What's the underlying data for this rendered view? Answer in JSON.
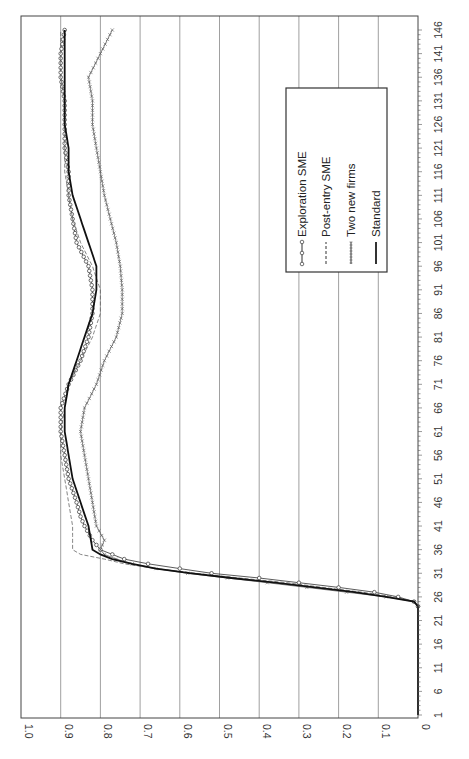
{
  "chart_data": {
    "type": "line",
    "orientation": "rotated-90-ccw",
    "title": "",
    "xlabel": "",
    "ylabel": "",
    "ylim": [
      0,
      1.0
    ],
    "xlim": [
      1,
      146
    ],
    "y_ticks": [
      "0",
      "0.1",
      "0.2",
      "0.3",
      "0.4",
      "0.5",
      "0.6",
      "0.7",
      "0.8",
      "0.9",
      "1.0"
    ],
    "x_ticks": [
      "1",
      "6",
      "11",
      "16",
      "21",
      "26",
      "31",
      "36",
      "41",
      "46",
      "51",
      "56",
      "61",
      "66",
      "71",
      "76",
      "81",
      "86",
      "91",
      "96",
      "101",
      "106",
      "111",
      "116",
      "121",
      "126",
      "131",
      "136",
      "141",
      "146"
    ],
    "grid": true,
    "legend_position": "upper-right (inside plot)",
    "series": [
      {
        "name": "Exploration SME",
        "style": "line-circle",
        "points": [
          [
            1,
            0
          ],
          [
            24,
            0
          ],
          [
            25,
            0.01
          ],
          [
            26,
            0.05
          ],
          [
            27,
            0.11
          ],
          [
            28,
            0.2
          ],
          [
            29,
            0.3
          ],
          [
            30,
            0.4
          ],
          [
            31,
            0.52
          ],
          [
            32,
            0.6
          ],
          [
            33,
            0.68
          ],
          [
            34,
            0.74
          ],
          [
            35,
            0.77
          ],
          [
            36,
            0.8
          ],
          [
            38,
            0.82
          ],
          [
            41,
            0.84
          ],
          [
            43,
            0.85
          ],
          [
            46,
            0.86
          ],
          [
            51,
            0.88
          ],
          [
            56,
            0.89
          ],
          [
            61,
            0.9
          ],
          [
            66,
            0.9
          ],
          [
            71,
            0.88
          ],
          [
            76,
            0.85
          ],
          [
            81,
            0.83
          ],
          [
            86,
            0.82
          ],
          [
            91,
            0.82
          ],
          [
            96,
            0.83
          ],
          [
            101,
            0.86
          ],
          [
            106,
            0.87
          ],
          [
            111,
            0.88
          ],
          [
            116,
            0.88
          ],
          [
            121,
            0.89
          ],
          [
            126,
            0.89
          ],
          [
            131,
            0.89
          ],
          [
            136,
            0.9
          ],
          [
            141,
            0.9
          ],
          [
            146,
            0.89
          ]
        ]
      },
      {
        "name": "Post-entry SME",
        "style": "dashed",
        "points": [
          [
            1,
            0
          ],
          [
            24,
            0
          ],
          [
            25,
            0.01
          ],
          [
            26,
            0.06
          ],
          [
            27,
            0.14
          ],
          [
            28,
            0.24
          ],
          [
            29,
            0.33
          ],
          [
            30,
            0.45
          ],
          [
            31,
            0.56
          ],
          [
            32,
            0.66
          ],
          [
            33,
            0.74
          ],
          [
            34,
            0.79
          ],
          [
            35,
            0.85
          ],
          [
            36,
            0.87
          ],
          [
            41,
            0.87
          ],
          [
            46,
            0.88
          ],
          [
            51,
            0.89
          ],
          [
            56,
            0.9
          ],
          [
            61,
            0.9
          ],
          [
            66,
            0.89
          ],
          [
            71,
            0.88
          ],
          [
            76,
            0.85
          ],
          [
            81,
            0.82
          ],
          [
            86,
            0.8
          ],
          [
            91,
            0.8
          ],
          [
            96,
            0.82
          ],
          [
            101,
            0.85
          ],
          [
            106,
            0.87
          ],
          [
            111,
            0.88
          ],
          [
            116,
            0.89
          ],
          [
            121,
            0.89
          ],
          [
            126,
            0.89
          ],
          [
            131,
            0.89
          ],
          [
            136,
            0.9
          ],
          [
            141,
            0.9
          ],
          [
            146,
            0.9
          ]
        ]
      },
      {
        "name": "Two new firms",
        "style": "line-cross",
        "points": [
          [
            1,
            0
          ],
          [
            24,
            0
          ],
          [
            25,
            0.01
          ],
          [
            26,
            0.08
          ],
          [
            27,
            0.18
          ],
          [
            28,
            0.28
          ],
          [
            29,
            0.38
          ],
          [
            30,
            0.48
          ],
          [
            31,
            0.58
          ],
          [
            32,
            0.66
          ],
          [
            33,
            0.72
          ],
          [
            34,
            0.76
          ],
          [
            35,
            0.79
          ],
          [
            36,
            0.8
          ],
          [
            38,
            0.79
          ],
          [
            41,
            0.81
          ],
          [
            46,
            0.82
          ],
          [
            51,
            0.83
          ],
          [
            56,
            0.84
          ],
          [
            61,
            0.85
          ],
          [
            66,
            0.84
          ],
          [
            71,
            0.81
          ],
          [
            76,
            0.79
          ],
          [
            81,
            0.76
          ],
          [
            86,
            0.745
          ],
          [
            91,
            0.745
          ],
          [
            96,
            0.75
          ],
          [
            101,
            0.76
          ],
          [
            106,
            0.775
          ],
          [
            111,
            0.79
          ],
          [
            116,
            0.8
          ],
          [
            121,
            0.81
          ],
          [
            126,
            0.82
          ],
          [
            131,
            0.82
          ],
          [
            136,
            0.83
          ],
          [
            141,
            0.8
          ],
          [
            146,
            0.77
          ]
        ]
      },
      {
        "name": "Standard",
        "style": "solid-bold",
        "points": [
          [
            1,
            0
          ],
          [
            24,
            0
          ],
          [
            25,
            0.01
          ],
          [
            26,
            0.08
          ],
          [
            27,
            0.16
          ],
          [
            28,
            0.26
          ],
          [
            29,
            0.36
          ],
          [
            30,
            0.47
          ],
          [
            31,
            0.57
          ],
          [
            32,
            0.66
          ],
          [
            33,
            0.72
          ],
          [
            34,
            0.77
          ],
          [
            35,
            0.8
          ],
          [
            36,
            0.82
          ],
          [
            41,
            0.83
          ],
          [
            46,
            0.85
          ],
          [
            51,
            0.87
          ],
          [
            56,
            0.88
          ],
          [
            61,
            0.89
          ],
          [
            66,
            0.89
          ],
          [
            71,
            0.88
          ],
          [
            76,
            0.86
          ],
          [
            81,
            0.84
          ],
          [
            86,
            0.82
          ],
          [
            91,
            0.81
          ],
          [
            96,
            0.81
          ],
          [
            101,
            0.83
          ],
          [
            106,
            0.85
          ],
          [
            111,
            0.87
          ],
          [
            116,
            0.88
          ],
          [
            121,
            0.88
          ],
          [
            126,
            0.89
          ],
          [
            131,
            0.89
          ],
          [
            136,
            0.89
          ],
          [
            141,
            0.89
          ],
          [
            146,
            0.89
          ]
        ]
      }
    ]
  },
  "legend": {
    "items": [
      {
        "label": "Exploration SME"
      },
      {
        "label": "Post-entry SME"
      },
      {
        "label": "Two new firms"
      },
      {
        "label": "Standard"
      }
    ]
  },
  "colors": {
    "axis": "#444444",
    "grid": "#888888",
    "series": "#333333",
    "background": "#ffffff"
  }
}
